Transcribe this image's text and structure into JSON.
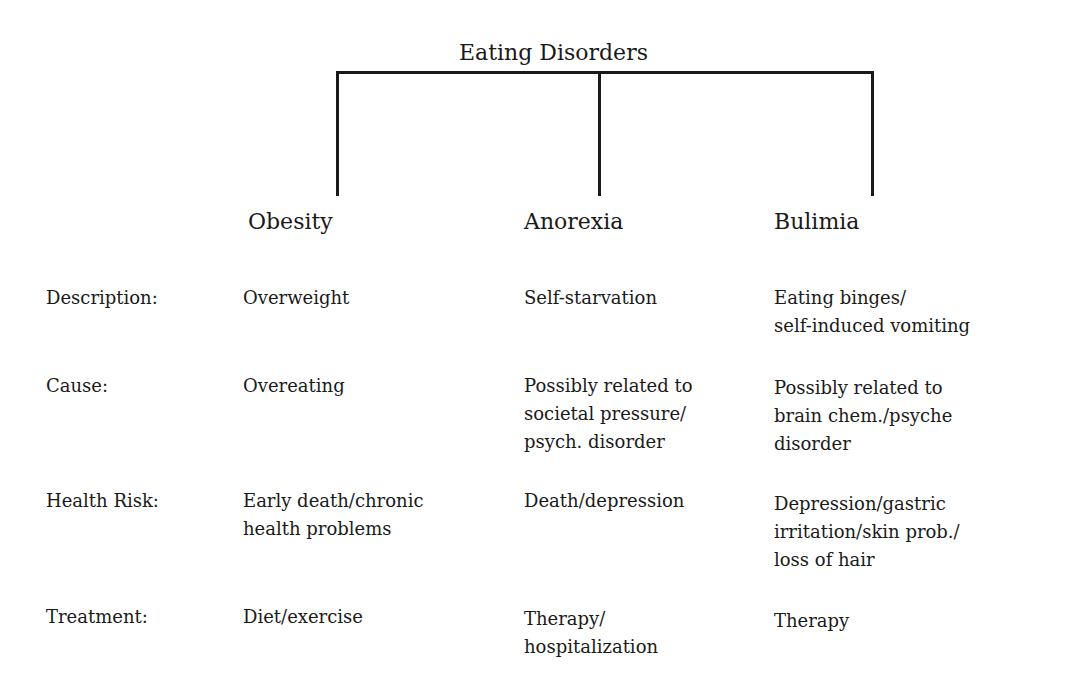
{
  "title": "Eating Disorders",
  "columns": [
    "Obesity",
    "Anorexia",
    "Bulimia"
  ],
  "rows": [
    {
      "label": "Description:",
      "cells": [
        "Overweight",
        "Self-starvation",
        "Eating binges/\nself-induced vomiting"
      ]
    },
    {
      "label": "Cause:",
      "cells": [
        "Overeating",
        "Possibly related to\nsocietal pressure/\npsych. disorder",
        "Possibly related to\nbrain chem./psyche\ndisorder"
      ]
    },
    {
      "label": "Health Risk:",
      "cells": [
        "Early death/chronic\nhealth problems",
        "Death/depression",
        "Depression/gastric\nirritation/skin prob./\nloss of hair"
      ]
    },
    {
      "label": "Treatment:",
      "cells": [
        "Diet/exercise",
        "Therapy/\nhospitalization",
        "Therapy"
      ]
    }
  ]
}
